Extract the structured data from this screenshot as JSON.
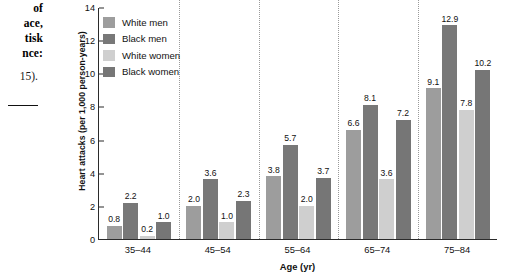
{
  "caption": {
    "lines": [
      "of",
      "ace,",
      "tisk",
      "nce:"
    ],
    "reference": "15)."
  },
  "chart_data": {
    "type": "bar",
    "title": "",
    "xlabel": "Age (yr)",
    "ylabel": "Heart attacks (per 1,000 person-years)",
    "categories": [
      "35–44",
      "45–54",
      "55–64",
      "65–74",
      "75–84"
    ],
    "ylim": [
      0,
      14
    ],
    "yticks": [
      0,
      2,
      4,
      6,
      8,
      10,
      12,
      14
    ],
    "grid": false,
    "legend_position": "top-left",
    "series": [
      {
        "name": "White men",
        "color": "#9d9d9d",
        "values": [
          0.8,
          2.0,
          3.8,
          6.6,
          9.1
        ]
      },
      {
        "name": "Black men",
        "color": "#787878",
        "values": [
          2.2,
          3.6,
          5.7,
          8.1,
          12.9
        ]
      },
      {
        "name": "White women",
        "color": "#cfcfcf",
        "values": [
          0.2,
          1.0,
          2.0,
          3.6,
          7.8
        ]
      },
      {
        "name": "Black women",
        "color": "#767676",
        "values": [
          1.0,
          2.3,
          3.7,
          7.2,
          10.2
        ]
      }
    ]
  }
}
